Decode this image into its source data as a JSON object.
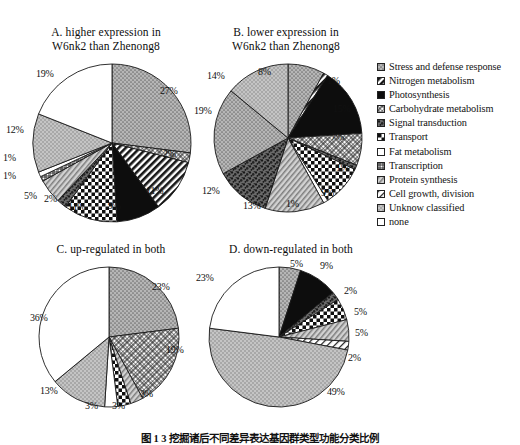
{
  "figure": {
    "caption": "图 1  3  挖掘诸后不同差异表达基因群类型功能分类比例"
  },
  "legend": {
    "items": [
      {
        "label": "Stress and defense response",
        "pattern": "dots-gray",
        "key": "stress"
      },
      {
        "label": "Nitrogen metabolism",
        "pattern": "diag-black",
        "key": "nitrogen"
      },
      {
        "label": "Photosynthesis",
        "pattern": "solid-black",
        "key": "photosynthesis"
      },
      {
        "label": " Carbohydrate metabolism",
        "pattern": "crosshatch-fine",
        "key": "carbohydrate"
      },
      {
        "label": "Signal transduction",
        "pattern": "speckle-dark",
        "key": "signal"
      },
      {
        "label": "Transport",
        "pattern": "checker-bold",
        "key": "transport"
      },
      {
        "label": "Fat metabolism",
        "pattern": "white-plain",
        "key": "fat"
      },
      {
        "label": "Transcription",
        "pattern": "grid-dense",
        "key": "transcription"
      },
      {
        "label": "Protein synthesis",
        "pattern": "diag-hatch",
        "key": "protein"
      },
      {
        "label": "Cell growth, division",
        "pattern": "diag-thin",
        "key": "cellgrowth"
      },
      {
        "label": "Unknow classified",
        "pattern": "dots-light",
        "key": "unknown"
      },
      {
        "label": "none",
        "pattern": "none-white",
        "key": "none"
      }
    ]
  },
  "chart_data": [
    {
      "id": "A",
      "type": "pie",
      "title": "A. higher expression in W6nk2 than Zhenong8",
      "title_lines": [
        "A. higher expression in",
        "W6nk2 than Zhenong8"
      ],
      "categories": [
        "Stress and defense response",
        "Carbohydrate metabolism",
        "Nitrogen metabolism",
        "Photosynthesis",
        "Transport",
        "Signal transduction",
        "Protein synthesis",
        "Transcription",
        "Fat metabolism",
        "Unknow classified",
        "none"
      ],
      "patterns": [
        "dots-gray",
        "crosshatch-fine",
        "diag-black",
        "solid-black",
        "checker-bold",
        "speckle-dark",
        "diag-hatch",
        "grid-dense",
        "white-plain",
        "dots-light",
        "none-white"
      ],
      "values": [
        27,
        2,
        11,
        9,
        11,
        2,
        5,
        1,
        1,
        12,
        19
      ],
      "labels": [
        "27%",
        "2%",
        "11%",
        "9%",
        "11%",
        "2%",
        "5%",
        "1%",
        "1%",
        "12%",
        "19%"
      ]
    },
    {
      "id": "B",
      "type": "pie",
      "title": "B. lower expression in W6nk2 than Zhenong8",
      "title_lines": [
        "B. lower expression in",
        "W6nk2 than Zhenong8"
      ],
      "categories": [
        "Stress and defense response",
        "Nitrogen metabolism",
        "Photosynthesis",
        "Carbohydrate metabolism",
        "Signal transduction",
        "Transport",
        "Fat metabolism",
        "Protein synthesis",
        "Transcription",
        "Cell growth, division",
        "Unknow classified",
        "none"
      ],
      "patterns": [
        "dots-gray",
        "diag-black",
        "solid-black",
        "crosshatch-fine",
        "speckle-dark",
        "checker-bold",
        "white-plain",
        "diag-hatch",
        "speckle-dark",
        "dots-gray",
        "dots-light",
        "none-white"
      ],
      "values": [
        8,
        1,
        15,
        7,
        1,
        9,
        1,
        13,
        12,
        19,
        14
      ],
      "labels": [
        "8%",
        "1%",
        "15%",
        "7%",
        "1%",
        "9%",
        "1%",
        "13%",
        "12%",
        "19%",
        "14%"
      ]
    },
    {
      "id": "C",
      "type": "pie",
      "title": "C. up-regulated in both",
      "title_lines": [
        "C. up-regulated in both"
      ],
      "categories": [
        "Stress and defense response",
        "Carbohydrate metabolism",
        "Protein synthesis",
        "Transport",
        "Fat metabolism",
        "Unknow classified",
        "none"
      ],
      "patterns": [
        "dots-gray",
        "crosshatch-fine",
        "diag-hatch",
        "checker-bold",
        "white-plain",
        "dots-light",
        "none-white"
      ],
      "values": [
        23,
        19,
        3,
        3,
        3,
        13,
        36
      ],
      "labels": [
        "23%",
        "19%",
        "3%",
        "3%",
        "3%",
        "13%",
        "36%"
      ]
    },
    {
      "id": "D",
      "type": "pie",
      "title": "D. down-regulated in both",
      "title_lines": [
        "D. down-regulated in both"
      ],
      "categories": [
        "Stress and defense response",
        "Photosynthesis",
        "Signal transduction",
        "Transport",
        "Protein synthesis",
        "Cell growth, division",
        "Unknow classified",
        "none"
      ],
      "patterns": [
        "dots-gray",
        "solid-black",
        "speckle-dark",
        "checker-bold",
        "diag-hatch",
        "diag-thin",
        "dots-light",
        "none-white"
      ],
      "values": [
        5,
        9,
        2,
        5,
        5,
        2,
        49,
        23
      ],
      "labels": [
        "5%",
        "9%",
        "2%",
        "5%",
        "5%",
        "2%",
        "49%",
        "23%"
      ]
    }
  ],
  "colors": {
    "gray_fill": "#a8a8a8",
    "light_gray": "#c9c9c9",
    "black": "#111111",
    "white": "#ffffff",
    "stroke": "#1a1a1a"
  }
}
